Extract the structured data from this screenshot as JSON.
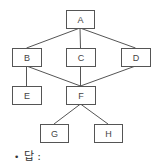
{
  "diagram": {
    "type": "hierarchy",
    "nodes": [
      {
        "id": "A",
        "label": "A",
        "x": 66,
        "y": 10,
        "w": 28,
        "h": 18
      },
      {
        "id": "B",
        "label": "B",
        "x": 12,
        "y": 48,
        "w": 29,
        "h": 18
      },
      {
        "id": "C",
        "label": "C",
        "x": 66,
        "y": 48,
        "w": 29,
        "h": 18
      },
      {
        "id": "D",
        "label": "D",
        "x": 121,
        "y": 48,
        "w": 29,
        "h": 18
      },
      {
        "id": "E",
        "label": "E",
        "x": 12,
        "y": 86,
        "w": 29,
        "h": 18
      },
      {
        "id": "F",
        "label": "F",
        "x": 66,
        "y": 86,
        "w": 29,
        "h": 18
      },
      {
        "id": "G",
        "label": "G",
        "x": 40,
        "y": 124,
        "w": 28,
        "h": 18
      },
      {
        "id": "H",
        "label": "H",
        "x": 94,
        "y": 124,
        "w": 28,
        "h": 18
      }
    ],
    "edges": [
      [
        "A",
        "B"
      ],
      [
        "A",
        "C"
      ],
      [
        "A",
        "D"
      ],
      [
        "B",
        "E"
      ],
      [
        "B",
        "F"
      ],
      [
        "C",
        "F"
      ],
      [
        "D",
        "F"
      ],
      [
        "F",
        "G"
      ],
      [
        "F",
        "H"
      ]
    ],
    "colors": {
      "stroke": "#555555",
      "text": "#444444"
    }
  },
  "answer": {
    "bullet": "•",
    "label": "답 :"
  }
}
